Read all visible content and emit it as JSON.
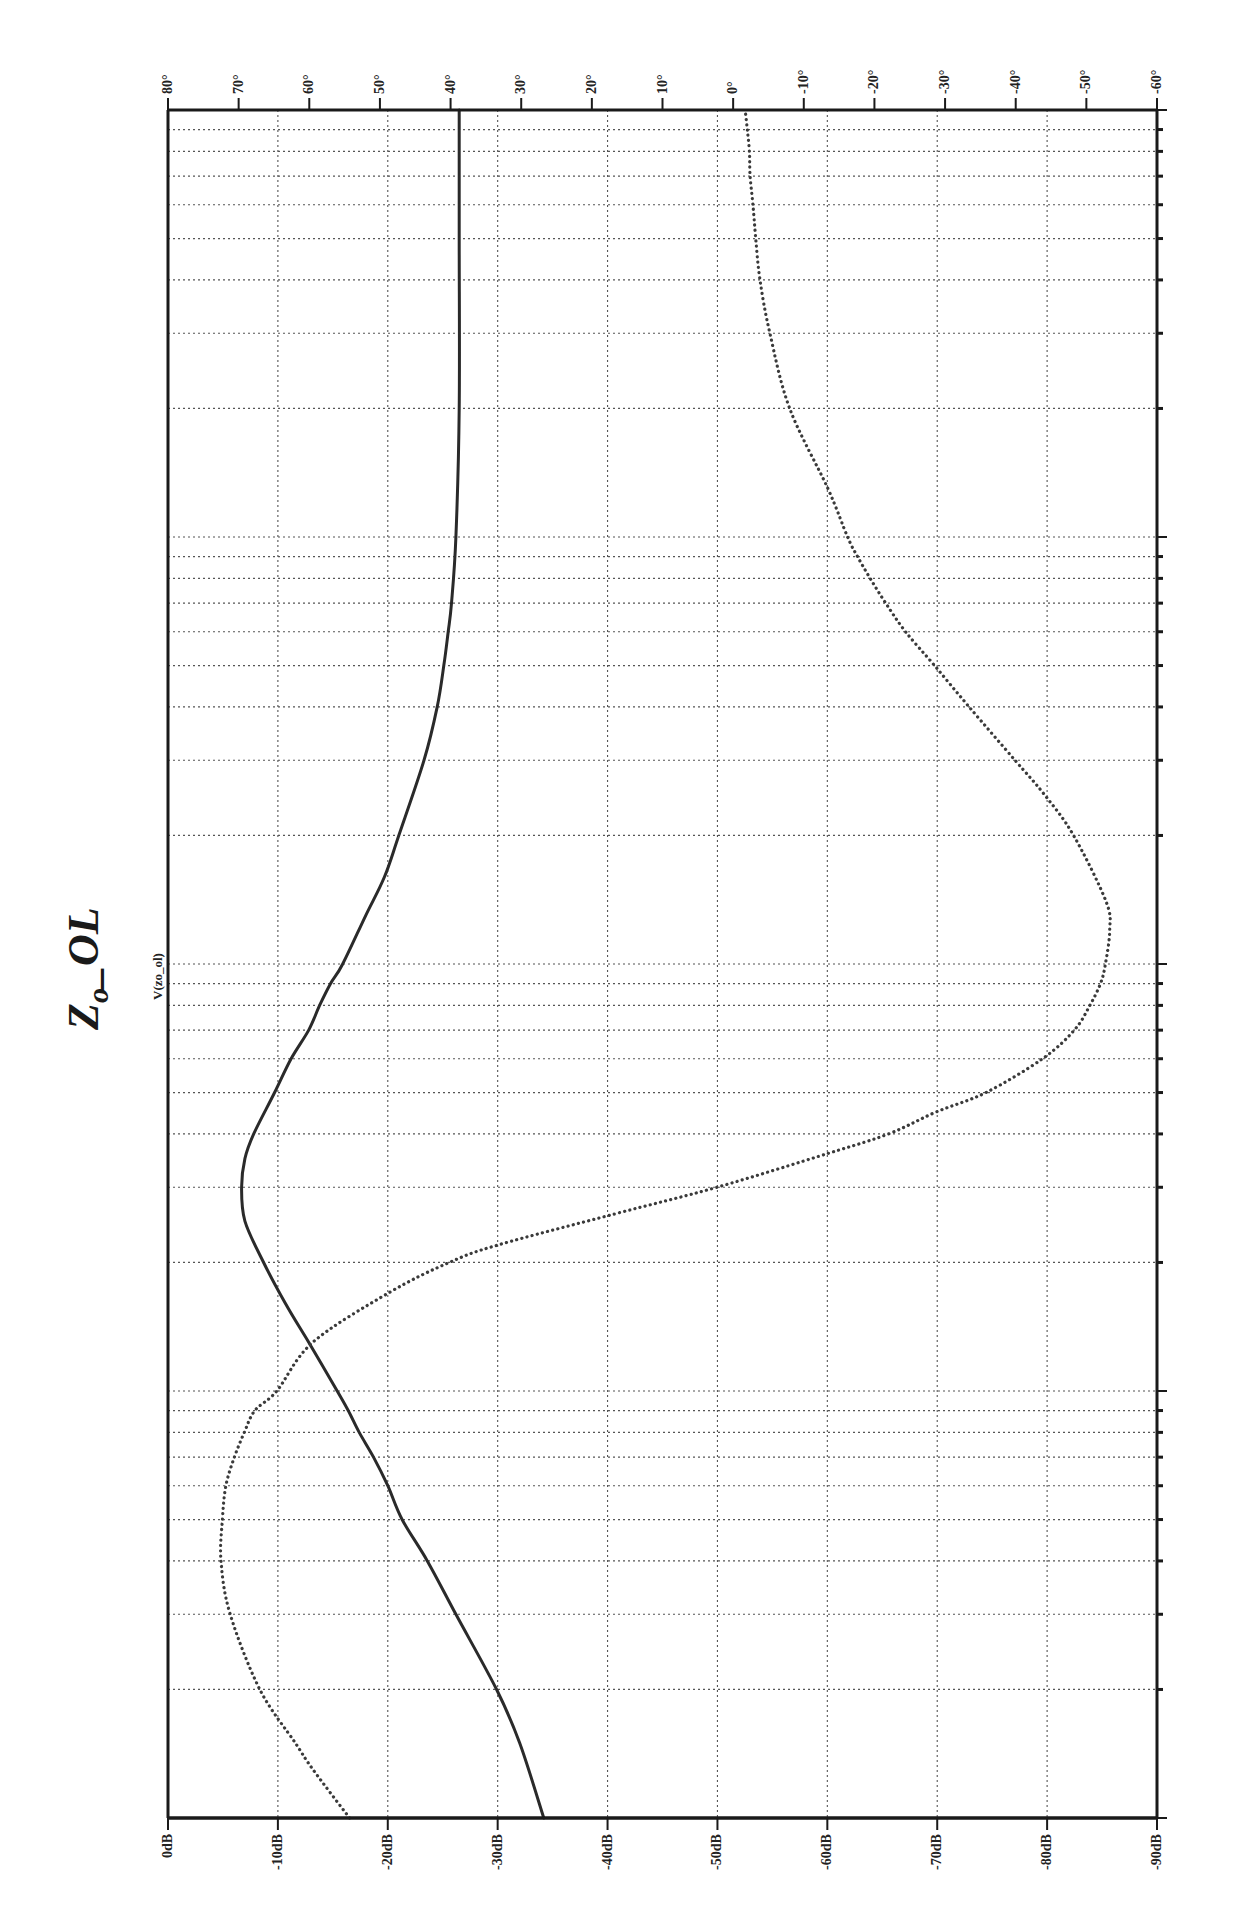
{
  "chart_data": {
    "type": "line",
    "title": "Zo_OL",
    "title_parts": {
      "main": "Z",
      "sub": "o",
      "rest": "_OL"
    },
    "trace_label": "V(zo_ol)",
    "orientation": "rotated-90 (frequency runs bottom-to-top along right edge; magnitude/phase run left-to-right)",
    "frequency_axis": {
      "label": "Frequency",
      "scale": "log",
      "range_hz": [
        100,
        1000000
      ],
      "tick_labels": [
        "100Hz",
        "1KHz",
        "10KHz",
        "100KHz",
        "1MHz"
      ],
      "tick_values_hz": [
        100,
        1000,
        10000,
        100000,
        1000000
      ]
    },
    "magnitude_axis": {
      "label": "Magnitude (dB)",
      "range": [
        0,
        -90
      ],
      "tick_labels": [
        "0dB",
        "-10dB",
        "-20dB",
        "-30dB",
        "-40dB",
        "-50dB",
        "-60dB",
        "-70dB",
        "-80dB",
        "-90dB"
      ],
      "tick_values": [
        0,
        -10,
        -20,
        -30,
        -40,
        -50,
        -60,
        -70,
        -80,
        -90
      ]
    },
    "phase_axis": {
      "label": "Phase (deg)",
      "range": [
        80,
        -60
      ],
      "tick_labels": [
        "80°",
        "70°",
        "60°",
        "50°",
        "40°",
        "30°",
        "20°",
        "10°",
        "0°",
        "-10°",
        "-20°",
        "-30°",
        "-40°",
        "-50°",
        "-60°"
      ],
      "tick_values": [
        80,
        70,
        60,
        50,
        40,
        30,
        20,
        10,
        0,
        -10,
        -20,
        -30,
        -40,
        -50,
        -60
      ]
    },
    "grid": true,
    "series": [
      {
        "name": "Magnitude",
        "style": "solid",
        "unit": "dB",
        "points": [
          {
            "f": 100,
            "v": -34.2
          },
          {
            "f": 150,
            "v": -32.0
          },
          {
            "f": 200,
            "v": -29.9
          },
          {
            "f": 300,
            "v": -26.2
          },
          {
            "f": 400,
            "v": -23.6
          },
          {
            "f": 500,
            "v": -21.3
          },
          {
            "f": 600,
            "v": -20.0
          },
          {
            "f": 700,
            "v": -18.7
          },
          {
            "f": 800,
            "v": -17.4
          },
          {
            "f": 900,
            "v": -16.4
          },
          {
            "f": 1000,
            "v": -15.4
          },
          {
            "f": 1300,
            "v": -12.8
          },
          {
            "f": 1600,
            "v": -10.7
          },
          {
            "f": 2000,
            "v": -8.7
          },
          {
            "f": 2500,
            "v": -7.0
          },
          {
            "f": 3000,
            "v": -6.7
          },
          {
            "f": 3500,
            "v": -7.0
          },
          {
            "f": 4000,
            "v": -7.8
          },
          {
            "f": 5000,
            "v": -9.7
          },
          {
            "f": 6000,
            "v": -11.2
          },
          {
            "f": 7000,
            "v": -12.8
          },
          {
            "f": 8000,
            "v": -13.8
          },
          {
            "f": 9000,
            "v": -14.8
          },
          {
            "f": 10000,
            "v": -15.9
          },
          {
            "f": 13000,
            "v": -18.0
          },
          {
            "f": 16000,
            "v": -19.7
          },
          {
            "f": 20000,
            "v": -21.0
          },
          {
            "f": 30000,
            "v": -23.3
          },
          {
            "f": 40000,
            "v": -24.5
          },
          {
            "f": 50000,
            "v": -25.1
          },
          {
            "f": 60000,
            "v": -25.5
          },
          {
            "f": 70000,
            "v": -25.8
          },
          {
            "f": 100000,
            "v": -26.2
          },
          {
            "f": 200000,
            "v": -26.5
          },
          {
            "f": 500000,
            "v": -26.5
          },
          {
            "f": 1000000,
            "v": -26.5
          }
        ]
      },
      {
        "name": "Phase",
        "style": "dotted",
        "unit": "deg",
        "points": [
          {
            "f": 100,
            "v": 54.3
          },
          {
            "f": 130,
            "v": 59.5
          },
          {
            "f": 150,
            "v": 62.0
          },
          {
            "f": 200,
            "v": 67.0
          },
          {
            "f": 300,
            "v": 71.2
          },
          {
            "f": 400,
            "v": 72.5
          },
          {
            "f": 500,
            "v": 72.3
          },
          {
            "f": 600,
            "v": 71.8
          },
          {
            "f": 700,
            "v": 70.6
          },
          {
            "f": 800,
            "v": 69.2
          },
          {
            "f": 900,
            "v": 67.7
          },
          {
            "f": 1000,
            "v": 64.6
          },
          {
            "f": 1300,
            "v": 59.5
          },
          {
            "f": 1700,
            "v": 48.7
          },
          {
            "f": 2000,
            "v": 40.2
          },
          {
            "f": 2200,
            "v": 33.2
          },
          {
            "f": 2600,
            "v": 16.7
          },
          {
            "f": 3000,
            "v": 2.3
          },
          {
            "f": 3600,
            "v": -13.4
          },
          {
            "f": 4000,
            "v": -22.0
          },
          {
            "f": 4500,
            "v": -28.7
          },
          {
            "f": 5000,
            "v": -35.8
          },
          {
            "f": 6000,
            "v": -43.8
          },
          {
            "f": 7000,
            "v": -48.3
          },
          {
            "f": 8000,
            "v": -50.5
          },
          {
            "f": 9000,
            "v": -52.0
          },
          {
            "f": 10000,
            "v": -52.7
          },
          {
            "f": 12000,
            "v": -53.3
          },
          {
            "f": 14000,
            "v": -52.8
          },
          {
            "f": 20000,
            "v": -48.2
          },
          {
            "f": 25000,
            "v": -44.0
          },
          {
            "f": 30000,
            "v": -39.9
          },
          {
            "f": 40000,
            "v": -33.4
          },
          {
            "f": 50000,
            "v": -28.5
          },
          {
            "f": 60000,
            "v": -24.4
          },
          {
            "f": 70000,
            "v": -21.6
          },
          {
            "f": 80000,
            "v": -19.4
          },
          {
            "f": 90000,
            "v": -17.6
          },
          {
            "f": 100000,
            "v": -16.2
          },
          {
            "f": 130000,
            "v": -13.4
          },
          {
            "f": 200000,
            "v": -8.0
          },
          {
            "f": 300000,
            "v": -5.2
          },
          {
            "f": 400000,
            "v": -3.8
          },
          {
            "f": 500000,
            "v": -3.2
          },
          {
            "f": 600000,
            "v": -2.8
          },
          {
            "f": 700000,
            "v": -2.4
          },
          {
            "f": 800000,
            "v": -2.3
          },
          {
            "f": 900000,
            "v": -2.0
          },
          {
            "f": 1000000,
            "v": -1.7
          }
        ]
      }
    ],
    "colors": {
      "frame": "#1a1a1a",
      "grid": "#555555",
      "magnitude": "#2a2a2a",
      "phase": "#3a3a3a",
      "background": "#ffffff"
    }
  }
}
